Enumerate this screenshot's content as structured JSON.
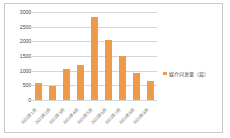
{
  "chart_data": {
    "type": "bar",
    "title": "",
    "xlabel": "",
    "ylabel": "",
    "categories": [
      "2021年1月",
      "2021年2月",
      "2021年3月",
      "2021年4月",
      "2021年5月",
      "2021年6月",
      "2021年7月",
      "2021年8月",
      "2021年9月"
    ],
    "values": [
      570,
      490,
      1070,
      1210,
      2830,
      2060,
      1510,
      910,
      640
    ],
    "series": [
      {
        "name": "媒介问发量（篇）",
        "values": [
          570,
          490,
          1070,
          1210,
          2830,
          2060,
          1510,
          910,
          640
        ]
      }
    ],
    "ylim": [
      0,
      3000
    ],
    "ytick_labels": [
      "3000",
      "2500",
      "2000",
      "1500",
      "1000",
      "500",
      "0"
    ],
    "ytick_values": [
      3000,
      2500,
      2000,
      1500,
      1000,
      500,
      0
    ],
    "grid": true,
    "legend_position": "right",
    "bar_color": "#ED9A4A",
    "gridline_color": "#D6D6D6",
    "axis_text_color": "#4A4A4A",
    "border_color": "#C9C9C9",
    "background": "#FFFFFF"
  },
  "legend": {
    "entries": [
      {
        "label": "媒介问发量（篇）",
        "color": "#ED9A4A"
      }
    ]
  }
}
